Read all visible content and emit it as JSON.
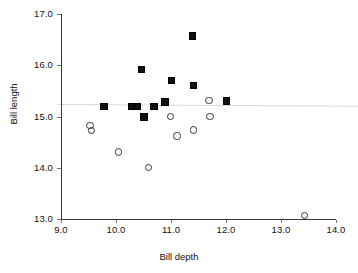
{
  "chart_data": {
    "type": "scatter",
    "title": "",
    "xlabel": "Bill depth",
    "ylabel": "Bill length",
    "xlim": [
      9.0,
      14.0
    ],
    "ylim": [
      13.0,
      17.0
    ],
    "xticks": [
      "9.0",
      "10.0",
      "11.0",
      "12.0",
      "13.0",
      "14.0"
    ],
    "yticks": [
      "13.0",
      "14.0",
      "15.0",
      "16.0",
      "17.0"
    ],
    "xtick_values": [
      9.0,
      10.0,
      11.0,
      12.0,
      13.0,
      14.0
    ],
    "ytick_values": [
      13.0,
      14.0,
      15.0,
      16.0,
      17.0
    ],
    "grid": false,
    "legend": "none",
    "annotations": [
      {
        "name": "regression-line",
        "type": "line",
        "description": "faint near-horizontal reference line at about y = 15.05, very slightly declining, drawn across and past the plot area",
        "y_left": 15.06,
        "y_right": 14.96,
        "color": "#d8d8d8"
      }
    ],
    "series": [
      {
        "name": "filled-squares",
        "marker": "filled-square",
        "color": "#111111",
        "points": [
          {
            "x": 9.77,
            "y": 15.2
          },
          {
            "x": 10.27,
            "y": 15.2
          },
          {
            "x": 10.38,
            "y": 15.2
          },
          {
            "x": 10.46,
            "y": 15.93
          },
          {
            "x": 10.5,
            "y": 15.0
          },
          {
            "x": 10.68,
            "y": 15.2
          },
          {
            "x": 10.88,
            "y": 15.29
          },
          {
            "x": 11.0,
            "y": 15.71
          },
          {
            "x": 11.38,
            "y": 16.58
          },
          {
            "x": 11.4,
            "y": 15.62
          },
          {
            "x": 12.0,
            "y": 15.31
          }
        ]
      },
      {
        "name": "open-circles",
        "marker": "open-circle",
        "color": "#333333",
        "points": [
          {
            "x": 9.52,
            "y": 14.84
          },
          {
            "x": 9.54,
            "y": 14.74
          },
          {
            "x": 10.04,
            "y": 14.32
          },
          {
            "x": 10.58,
            "y": 14.01
          },
          {
            "x": 10.98,
            "y": 15.01
          },
          {
            "x": 11.1,
            "y": 14.63
          },
          {
            "x": 11.4,
            "y": 14.75
          },
          {
            "x": 11.68,
            "y": 15.32
          },
          {
            "x": 11.7,
            "y": 15.01
          },
          {
            "x": 13.42,
            "y": 13.08
          }
        ]
      }
    ]
  }
}
